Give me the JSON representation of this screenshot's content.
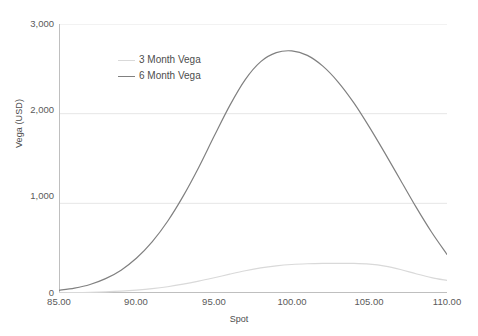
{
  "chart_data": {
    "type": "line",
    "title": "",
    "xlabel": "Spot",
    "ylabel": "Vega (USD)",
    "xlim": [
      85,
      110
    ],
    "ylim": [
      0,
      3000
    ],
    "xticks": [
      "85.00",
      "90.00",
      "95.00",
      "100.00",
      "105.00",
      "110.00"
    ],
    "yticks": [
      "0",
      "1,000",
      "2,000",
      "3,000"
    ],
    "grid": "horizontal",
    "legend_position": "inside-top-left",
    "x": [
      85,
      86,
      87,
      88,
      89,
      90,
      91,
      92,
      93,
      94,
      95,
      96,
      97,
      98,
      99,
      100,
      101,
      102,
      103,
      104,
      105,
      106,
      107,
      108,
      109,
      110
    ],
    "series": [
      {
        "name": "3 Month Vega",
        "color": "#d9d9d9",
        "values": [
          2,
          4,
          7,
          12,
          20,
          32,
          48,
          70,
          98,
          132,
          170,
          210,
          248,
          280,
          303,
          318,
          326,
          330,
          331,
          330,
          322,
          300,
          262,
          215,
          172,
          140
        ]
      },
      {
        "name": "6 Month Vega",
        "color": "#808080",
        "values": [
          30,
          55,
          95,
          160,
          255,
          390,
          570,
          800,
          1080,
          1400,
          1750,
          2090,
          2380,
          2580,
          2680,
          2700,
          2650,
          2530,
          2350,
          2120,
          1850,
          1560,
          1260,
          960,
          680,
          430
        ]
      }
    ]
  },
  "legend": {
    "items": [
      {
        "label": "3 Month Vega",
        "color": "#d9d9d9"
      },
      {
        "label": "6 Month Vega",
        "color": "#808080"
      }
    ]
  },
  "axes": {
    "y_title": "Vega (USD)",
    "x_title": "Spot"
  },
  "colors": {
    "gridline": "#e6e6e6",
    "axis": "#bfbfbf",
    "text": "#5a5a5a",
    "background": "#ffffff"
  }
}
